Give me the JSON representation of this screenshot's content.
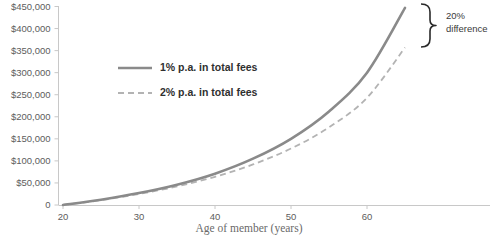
{
  "chart_data": {
    "type": "line",
    "title": "",
    "subtitle": "",
    "xlabel": "Age of member (years)",
    "ylabel": "",
    "xlim": [
      19,
      66
    ],
    "ylim": [
      0,
      450000
    ],
    "grid": false,
    "legend_position": "inside-upper-left",
    "x_ticks": [
      20,
      30,
      40,
      50,
      60
    ],
    "x_tick_labels": [
      "20",
      "30",
      "40",
      "50",
      "60"
    ],
    "y_ticks": [
      0,
      50000,
      100000,
      150000,
      200000,
      250000,
      300000,
      350000,
      400000,
      450000
    ],
    "y_tick_labels": [
      "0",
      "$50,000",
      "$100,000",
      "$150,000",
      "$200,000",
      "$250,000",
      "$300,000",
      "$350,000",
      "$400,000",
      "$450,000"
    ],
    "x": [
      20,
      25,
      30,
      35,
      40,
      45,
      50,
      55,
      60,
      65
    ],
    "series": [
      {
        "name": "1% p.a. in total fees",
        "style": "solid",
        "color": "#8a8a8a",
        "values": [
          0,
          12000,
          27000,
          46000,
          71000,
          105000,
          150000,
          212000,
          300000,
          447000
        ]
      },
      {
        "name": "2% p.a. in total fees",
        "style": "dashed",
        "color": "#b3b3b3",
        "values": [
          0,
          11000,
          25000,
          42000,
          64000,
          92000,
          128000,
          176000,
          243000,
          357000
        ]
      }
    ],
    "annotations": [
      {
        "name": "difference-brace",
        "text_line1": "20%",
        "text_line2": "difference",
        "at_x": 65,
        "span_top": 447000,
        "span_bottom": 357000
      }
    ]
  },
  "axes": {
    "x_title": "Age of member (years)"
  },
  "legend": {
    "items": [
      {
        "label": "1% p.a. in total fees"
      },
      {
        "label": "2% p.a. in total fees"
      }
    ]
  },
  "annotation": {
    "line1": "20%",
    "line2": "difference"
  },
  "ticks": {
    "y": [
      "$450,000",
      "$400,000",
      "$350,000",
      "$300,000",
      "$250,000",
      "$200,000",
      "$150,000",
      "$100,000",
      "$50,000",
      "0"
    ],
    "x": [
      "20",
      "30",
      "40",
      "50",
      "60"
    ]
  },
  "colors": {
    "series_1": "#8a8a8a",
    "series_2": "#b3b3b3",
    "axis": "#c8c8c8",
    "tick_text": "#5d5d5d",
    "title_text": "#6a6a6a",
    "legend_text": "#2f2f2f",
    "annotation": "#3a3a3a"
  }
}
